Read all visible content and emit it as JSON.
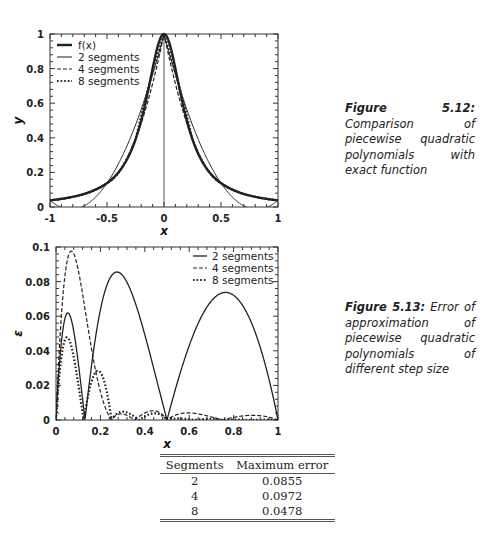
{
  "chart_data": [
    {
      "id": "fig-5-12",
      "type": "line",
      "title": "",
      "xlabel": "x",
      "ylabel": "y",
      "xlim": [
        -1,
        1
      ],
      "ylim": [
        0,
        1
      ],
      "xticks": [
        -1,
        -0.5,
        0,
        0.5,
        1
      ],
      "xtick_labels": [
        "-1",
        "-0.5",
        "0",
        "0.5",
        "1"
      ],
      "yticks": [
        0,
        0.2,
        0.4,
        0.6,
        0.8,
        1
      ],
      "ytick_labels": [
        "0",
        "0.2",
        "0.4",
        "0.6",
        "0.8",
        "1"
      ],
      "grid": false,
      "legend_position": "upper left",
      "function": "f(x) = 1/(1+25x^2)",
      "series": [
        {
          "name": "f(x)",
          "style": "solid-thick",
          "x": [
            -1,
            -0.75,
            -0.5,
            -0.25,
            0,
            0.25,
            0.5,
            0.75,
            1
          ],
          "values": [
            0.038,
            0.066,
            0.138,
            0.39,
            1,
            0.39,
            0.138,
            0.066,
            0.038
          ]
        },
        {
          "name": "2 segments",
          "style": "solid-thin",
          "segments": 2
        },
        {
          "name": "4 segments",
          "style": "dashed",
          "segments": 4
        },
        {
          "name": "8 segments",
          "style": "dotted",
          "segments": 8
        }
      ],
      "caption": {
        "label": "Figure 5.12:",
        "text": "Comparison of piecewise quadratic polynomials with exact function"
      }
    },
    {
      "id": "fig-5-13",
      "type": "line",
      "title": "",
      "xlabel": "x",
      "ylabel": "ε",
      "xlim": [
        0,
        1
      ],
      "ylim": [
        0,
        0.1
      ],
      "xticks": [
        0,
        0.2,
        0.4,
        0.6,
        0.8,
        1
      ],
      "xtick_labels": [
        "0",
        "0.2",
        "0.4",
        "0.6",
        "0.8",
        "1"
      ],
      "yticks": [
        0,
        0.02,
        0.04,
        0.06,
        0.08,
        0.1
      ],
      "ytick_labels": [
        "0",
        "0.02",
        "0.04",
        "0.06",
        "0.08",
        "0.1"
      ],
      "grid": false,
      "legend_position": "upper right",
      "series": [
        {
          "name": "2 segments",
          "style": "solid",
          "segments": 2,
          "peaks": [
            [
              0.06,
              0.062
            ],
            [
              0.27,
              0.0855
            ],
            [
              0.76,
              0.074
            ]
          ]
        },
        {
          "name": "4 segments",
          "style": "dashed",
          "segments": 4,
          "peaks": [
            [
              0.07,
              0.0972
            ],
            [
              0.19,
              0.028
            ],
            [
              0.42,
              0.006
            ],
            [
              0.6,
              0.005
            ],
            [
              0.87,
              0.003
            ]
          ]
        },
        {
          "name": "8 segments",
          "style": "dotted",
          "segments": 8,
          "peaks": [
            [
              0.05,
              0.0478
            ],
            [
              0.19,
              0.029
            ],
            [
              0.3,
              0.005
            ],
            [
              0.44,
              0.005
            ]
          ]
        }
      ],
      "caption": {
        "label": "Figure 5.13:",
        "text": "Error of approximation of piecewise quadratic polynomials of different step size"
      }
    },
    {
      "id": "max-error-table",
      "type": "table",
      "columns": [
        "Segments",
        "Maximum error"
      ],
      "rows": [
        [
          "2",
          "0.0855"
        ],
        [
          "4",
          "0.0972"
        ],
        [
          "8",
          "0.0478"
        ]
      ]
    }
  ],
  "fig12": {
    "caption_label": "Figure 5.12:",
    "caption_text": " Comparison of piecewise quadratic polynomials with exact function",
    "xlabel": "x",
    "ylabel": "y",
    "legend": [
      "f(x)",
      "2 segments",
      "4 segments",
      "8 segments"
    ]
  },
  "fig13": {
    "caption_label": "Figure 5.13:",
    "caption_text": " Error of approximation of piecewise quadratic polynomials of different step size",
    "xlabel": "x",
    "ylabel": "ε",
    "legend": [
      "2 segments",
      "4 segments",
      "8 segments"
    ]
  },
  "table": {
    "headers": [
      "Segments",
      "Maximum error"
    ],
    "rows": [
      [
        "2",
        "0.0855"
      ],
      [
        "4",
        "0.0972"
      ],
      [
        "8",
        "0.0478"
      ]
    ]
  }
}
